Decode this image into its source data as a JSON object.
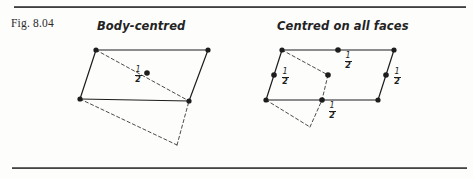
{
  "figure": {
    "label": "Fig. 8.04",
    "rules": {
      "top_rule": "horizontal-rule",
      "bottom_rule": "horizontal-rule"
    }
  },
  "diagrams": [
    {
      "id": "body-centred",
      "title": "Body-centred",
      "description": "Parallelogram unit cell drawn in oblique projection with a single lattice point at the body centre",
      "solid_edges": [
        {
          "from": [
            96,
            50
          ],
          "to": [
            208,
            50
          ]
        },
        {
          "from": [
            208,
            50
          ],
          "to": [
            189,
            101
          ]
        },
        {
          "from": [
            189,
            101
          ],
          "to": [
            80,
            99
          ]
        },
        {
          "from": [
            80,
            99
          ],
          "to": [
            96,
            50
          ]
        }
      ],
      "dashed_edges": [
        {
          "from": [
            96,
            50
          ],
          "to": [
            189,
            101
          ]
        },
        {
          "from": [
            80,
            99
          ],
          "to": [
            177,
            145
          ]
        },
        {
          "from": [
            177,
            145
          ],
          "to": [
            189,
            101
          ]
        }
      ],
      "vertices": [
        [
          96,
          50
        ],
        [
          208,
          50
        ],
        [
          189,
          101
        ],
        [
          80,
          99
        ]
      ],
      "lattice_points": [
        {
          "pos": [
            147,
            73
          ],
          "label": "1/2",
          "label_pos": [
            132,
            66
          ],
          "kind": "body-centre"
        }
      ]
    },
    {
      "id": "centred-on-all-faces",
      "title": "Centred on all faces",
      "description": "Parallelogram unit cell drawn in oblique projection with lattice points at the centre of each face",
      "solid_edges": [
        {
          "from": [
            282,
            50
          ],
          "to": [
            394,
            50
          ]
        },
        {
          "from": [
            394,
            50
          ],
          "to": [
            378,
            100
          ]
        },
        {
          "from": [
            378,
            100
          ],
          "to": [
            266,
            100
          ]
        },
        {
          "from": [
            266,
            100
          ],
          "to": [
            282,
            50
          ]
        }
      ],
      "dashed_edges": [
        {
          "from": [
            282,
            50
          ],
          "to": [
            328,
            75
          ]
        },
        {
          "from": [
            328,
            75
          ],
          "to": [
            322,
            100
          ]
        },
        {
          "from": [
            266,
            100
          ],
          "to": [
            310,
            127
          ]
        },
        {
          "from": [
            310,
            127
          ],
          "to": [
            322,
            100
          ]
        }
      ],
      "vertices": [
        [
          282,
          50
        ],
        [
          394,
          50
        ],
        [
          378,
          100
        ],
        [
          266,
          100
        ]
      ],
      "lattice_points": [
        {
          "pos": [
            338,
            50
          ],
          "label": "1/2",
          "label_pos": [
            342,
            52
          ],
          "kind": "top-face-centre"
        },
        {
          "pos": [
            274,
            75
          ],
          "label": "1/2",
          "label_pos": [
            279,
            68
          ],
          "kind": "left-face-centre"
        },
        {
          "pos": [
            386,
            75
          ],
          "label": "1/2",
          "label_pos": [
            391,
            68
          ],
          "kind": "right-face-centre"
        },
        {
          "pos": [
            322,
            100
          ],
          "label": "1/2",
          "label_pos": [
            326,
            102
          ],
          "kind": "bottom-face-centre"
        },
        {
          "pos": [
            328,
            75
          ],
          "label": "",
          "label_pos": [
            0,
            0
          ],
          "kind": "interior-face-centre"
        }
      ]
    }
  ],
  "colors": {
    "ink": "#1d1d1d",
    "rule": "#3a3a3a",
    "paper": "#fdfdfc"
  }
}
